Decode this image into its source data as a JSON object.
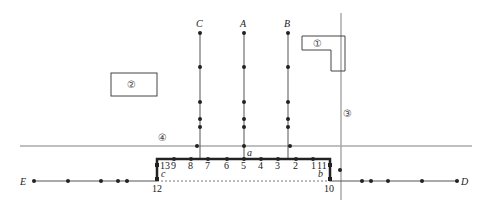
{
  "colors": {
    "line": "#555555",
    "thick_line": "#222222",
    "grey_road": "#aaaaaa",
    "dot": "#222222",
    "box": "#444444"
  },
  "vertical_lines": [
    {
      "label": "C",
      "x": 200,
      "y_top": 33,
      "y_bottom": 159,
      "dots": [
        33,
        67,
        102,
        119,
        127
      ],
      "cross_dot": {
        "x": 197,
        "y": 146
      }
    },
    {
      "label": "A",
      "x": 244,
      "y_top": 33,
      "y_bottom": 159,
      "dots": [
        33,
        67,
        102,
        119,
        127,
        146
      ]
    },
    {
      "label": "B",
      "x": 288,
      "y_top": 33,
      "y_bottom": 159,
      "dots": [
        33,
        67,
        102,
        119,
        127
      ],
      "cross_dot": {
        "x": 290,
        "y": 146
      }
    }
  ],
  "thick_frame": {
    "top_y": 159,
    "left_x": 157,
    "right_x": 330,
    "bottom_y": 179,
    "label_a": {
      "text": "a",
      "x": 247,
      "y": 156
    },
    "label_b": {
      "text": "b",
      "x": 318,
      "y": 177
    },
    "label_c": {
      "text": "c",
      "x": 161,
      "y": 177
    }
  },
  "numbered_points": [
    {
      "text": "13",
      "x": 157,
      "y": 165,
      "lx": 160,
      "ly": 169
    },
    {
      "text": "9",
      "x": 174,
      "y": 159,
      "lx": 171,
      "ly": 169
    },
    {
      "text": "8",
      "x": 191,
      "y": 159,
      "lx": 188,
      "ly": 169
    },
    {
      "text": "7",
      "x": 208,
      "y": 159,
      "lx": 205,
      "ly": 169
    },
    {
      "text": "6",
      "x": 227,
      "y": 159,
      "lx": 224,
      "ly": 169
    },
    {
      "text": "5",
      "x": 244,
      "y": 159,
      "lx": 241,
      "ly": 169
    },
    {
      "text": "4",
      "x": 261,
      "y": 159,
      "lx": 258,
      "ly": 169
    },
    {
      "text": "3",
      "x": 278,
      "y": 159,
      "lx": 275,
      "ly": 169
    },
    {
      "text": "2",
      "x": 296,
      "y": 159,
      "lx": 293,
      "ly": 169
    },
    {
      "text": "1",
      "x": 313,
      "y": 159,
      "lx": 311,
      "ly": 169
    },
    {
      "text": "11",
      "x": 330,
      "y": 165,
      "lx": 317,
      "ly": 169
    },
    {
      "text": "12",
      "x": 157,
      "y": 179,
      "lx": 152,
      "ly": 192
    },
    {
      "text": "10",
      "x": 330,
      "y": 179,
      "lx": 324,
      "ly": 192
    }
  ],
  "ed_line": {
    "y": 181,
    "E": {
      "text": "E",
      "x": 20,
      "y": 185
    },
    "D": {
      "text": "D",
      "x": 461,
      "y": 185
    },
    "dashed_from": 157,
    "dashed_to": 330,
    "left_dots": [
      34,
      68,
      101,
      118,
      127
    ],
    "right_dots": [
      362,
      371,
      388,
      422,
      457
    ]
  },
  "extra_dot": {
    "x": 340,
    "y": 170
  },
  "roads": {
    "road3": {
      "label": "③",
      "x": 341,
      "y1": 13,
      "y2": 200,
      "lx": 343,
      "ly": 117
    },
    "road4": {
      "label": "④",
      "y": 146,
      "x1": 20,
      "x2": 472,
      "lx": 158,
      "ly": 141
    }
  },
  "buildings": {
    "b1": {
      "label": "①",
      "points": "302,36 345,36 345,71 331,71 331,50 302,50",
      "lx": 313,
      "ly": 47
    },
    "b2": {
      "label": "②",
      "x": 111,
      "y": 73,
      "w": 46,
      "h": 23,
      "lx": 127,
      "ly": 88
    }
  }
}
